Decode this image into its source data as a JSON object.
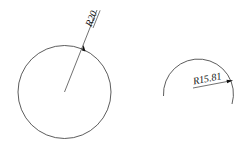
{
  "drawing": {
    "background": "#ffffff",
    "stroke_color": "#333333",
    "full_circle": {
      "center": [
        64.5,
        92
      ],
      "radius": 46.5,
      "dimension_label": "R20"
    },
    "arc": {
      "center": [
        198,
        90
      ],
      "radius": 35,
      "dimension_label": "R15.81"
    }
  }
}
